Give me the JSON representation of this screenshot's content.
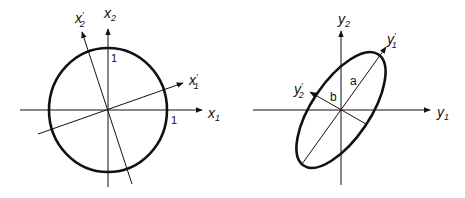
{
  "left_panel": {
    "shape": "unit circle",
    "axes": {
      "x1": {
        "base": "x",
        "sub": "1",
        "prime": ""
      },
      "x2": {
        "base": "x",
        "sub": "2",
        "prime": ""
      },
      "x1p": {
        "base": "x",
        "sub": "1",
        "prime": "′"
      },
      "x2p": {
        "base": "x",
        "sub": "2",
        "prime": "′"
      }
    },
    "ticks": {
      "x1_one": "1",
      "x2_one": "1"
    }
  },
  "right_panel": {
    "shape": "ellipse",
    "axes": {
      "y1": {
        "base": "y",
        "sub": "1",
        "prime": ""
      },
      "y2": {
        "base": "y",
        "sub": "2",
        "prime": ""
      },
      "y1p": {
        "base": "y",
        "sub": "1",
        "prime": "′"
      },
      "y2p": {
        "base": "y",
        "sub": "2",
        "prime": "′"
      }
    },
    "semi_axes": {
      "a": "a",
      "b": "b"
    }
  }
}
